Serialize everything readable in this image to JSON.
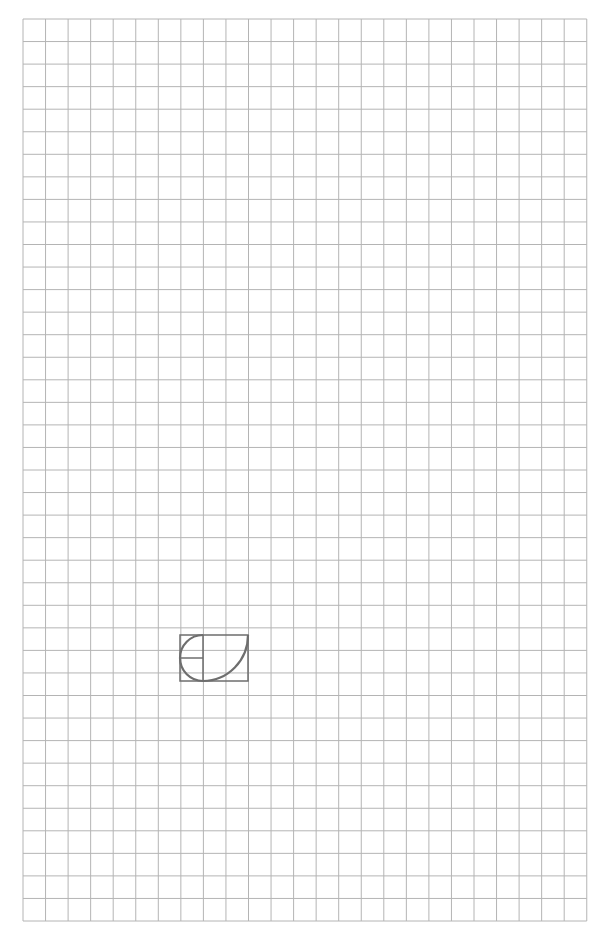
{
  "grid": {
    "left": 23,
    "top": 19,
    "cols": 25,
    "rows": 40,
    "cell": 22.55,
    "line_color": "#b4b4b4"
  },
  "shape": {
    "stroke": "#6e6e6e",
    "rect": {
      "x": 180,
      "y": 635,
      "w": 68,
      "h": 46
    },
    "divider_x": 203,
    "half_line_y": 658
  }
}
